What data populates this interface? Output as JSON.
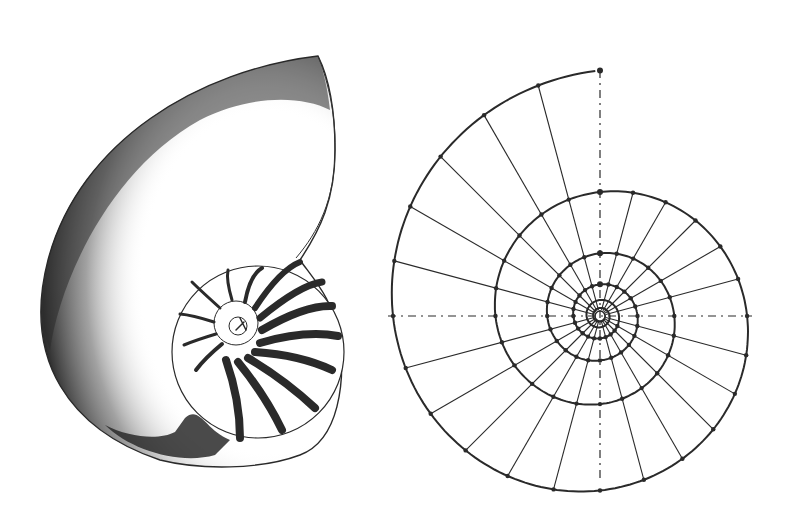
{
  "figure": {
    "panels": [
      {
        "id": "nautilus-shell",
        "description": "Stippled drawing of a sectioned nautilus shell showing chambers and septa"
      },
      {
        "id": "log-spiral-construction",
        "description": "Geometric construction of a logarithmic spiral with radial lines, concentric spiral turns, node dots and dashed axes"
      }
    ],
    "colors": {
      "ink": "#2a2a2a",
      "paper": "#ffffff"
    },
    "spiral": {
      "center": [
        600,
        316
      ],
      "start_radius": 124,
      "growth_per_turn": 1.98,
      "radial_divisions": 24,
      "inner_turns": 6
    }
  }
}
